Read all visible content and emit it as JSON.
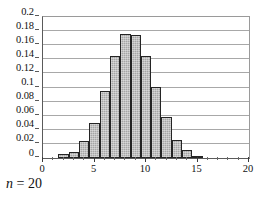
{
  "chart_data": {
    "type": "bar",
    "title": "",
    "subtitle": "",
    "xlabel": "",
    "ylabel": "",
    "xlim": [
      0,
      20
    ],
    "ylim": [
      0,
      0.2
    ],
    "grid": true,
    "legend": null,
    "bar_align": "centered-on-integer",
    "bar_width_units": 1,
    "x": [
      0,
      1,
      2,
      3,
      4,
      5,
      6,
      7,
      8,
      9,
      10,
      11,
      12,
      13,
      14,
      15,
      16,
      17,
      18,
      19,
      20
    ],
    "values": [
      0,
      0,
      0.005,
      0.0085,
      0.024,
      0.0495,
      0.0955,
      0.1445,
      0.1765,
      0.175,
      0.1445,
      0.1005,
      0.0585,
      0.025,
      0.011,
      0.003,
      0,
      0,
      0,
      0,
      0
    ],
    "categories": [
      "0",
      "1",
      "2",
      "3",
      "4",
      "5",
      "6",
      "7",
      "8",
      "9",
      "10",
      "11",
      "12",
      "13",
      "14",
      "15",
      "16",
      "17",
      "18",
      "19",
      "20"
    ],
    "yticks": [
      0,
      0.02,
      0.04,
      0.06,
      0.08,
      0.1,
      0.12,
      0.14,
      0.16,
      0.18,
      0.2
    ],
    "ytick_labels": [
      "0",
      "0.02",
      "0.04",
      "0.06",
      "0.08",
      "0.1",
      "0.12",
      "0.14",
      "0.16",
      "0.18",
      "0.2"
    ],
    "xticks": [
      0,
      5,
      10,
      15,
      20
    ],
    "xtick_labels": [
      "0",
      "5",
      "10",
      "15",
      "20"
    ],
    "xtick_minor_step": 1,
    "annotations": [
      {
        "text": "n = 20",
        "variable": "n",
        "relation": "=",
        "value": "20",
        "position": "below-left"
      }
    ],
    "colors": {
      "bar_fill": "#a6a6a6",
      "bar_border": "#242424",
      "gridline": "#a8a8a8",
      "axis": "#5a5a5a",
      "frame": "#9a9a9a",
      "text": "#111111",
      "background": "#ffffff"
    }
  },
  "caption": {
    "variable": "n",
    "equals": " = ",
    "value": "20"
  }
}
